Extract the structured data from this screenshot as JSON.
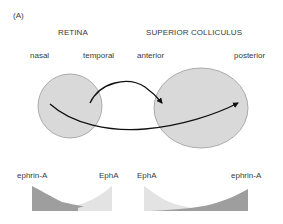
{
  "panel_label": "(A)",
  "retina": {
    "title": "RETINA",
    "left_label": "nasal",
    "right_label": "temporal"
  },
  "colliculus": {
    "title": "SUPERIOR COLLICULUS",
    "left_label": "anterior",
    "right_label": "posterior"
  },
  "gradients": {
    "retina": {
      "left_label": "ephrin-A",
      "right_label": "EphA"
    },
    "colliculus": {
      "left_label": "EphA",
      "right_label": "ephrin-A"
    }
  },
  "colors": {
    "circle_fill": "#d9d9d9",
    "circle_stroke": "#9a9a9a",
    "arrow": "#111111",
    "dark_gradient": "#9e9e9e",
    "light_gradient": "#e3e3e3"
  }
}
